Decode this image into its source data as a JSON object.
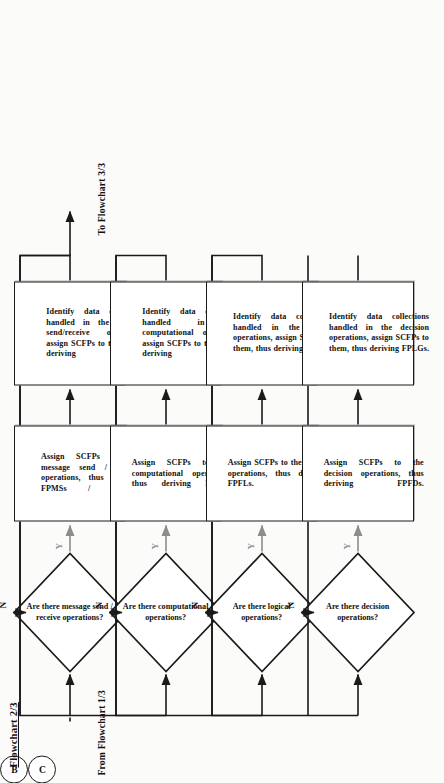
{
  "document": {
    "title": "Flowchart 2/3",
    "entry_label": "From Flowchart 1/3",
    "exit_label": "To Flowchart 3/3",
    "entry_connector": "B",
    "exit_connector": "C",
    "yes_label": "Y",
    "no_label": "N"
  },
  "branches": [
    {
      "id": "message",
      "decision": "Are there message send / receive operations?",
      "assign": "Assign SCFPs to the message send / receive operations, thus deriving FPMSs / FPMRs.",
      "identify": "Identify data collections handled in the message send/receive operations, assign SCFPs to them, thus deriving FPLSs."
    },
    {
      "id": "computational",
      "decision": "Are there computational operations?",
      "assign": "Assign SCFPs to the computational operations, thus deriving FPFCs.",
      "identify": "Identify data collections handled in the computational operations, assign SCFPs to them, thus deriving FPLGs."
    },
    {
      "id": "logical",
      "decision": "Are there logical operations?",
      "assign": "Assign SCFPs to the logical operations, thus deriving FPFLs.",
      "identify": "Identify data collections handled in the logical operations, assign SCFPs to them, thus deriving FPLGs."
    },
    {
      "id": "decision",
      "decision": "Are there decision operations?",
      "assign": "Assign SCFPs to the decision operations, thus deriving FPFDs.",
      "identify": "Identify data collections handled in the decision operations, assign SCFPs to them, thus deriving FPLGs."
    }
  ],
  "colors": {
    "ink": "#1a1a1a",
    "paper": "#fbfbfa",
    "gray_arrow": "#8d8d8d"
  }
}
